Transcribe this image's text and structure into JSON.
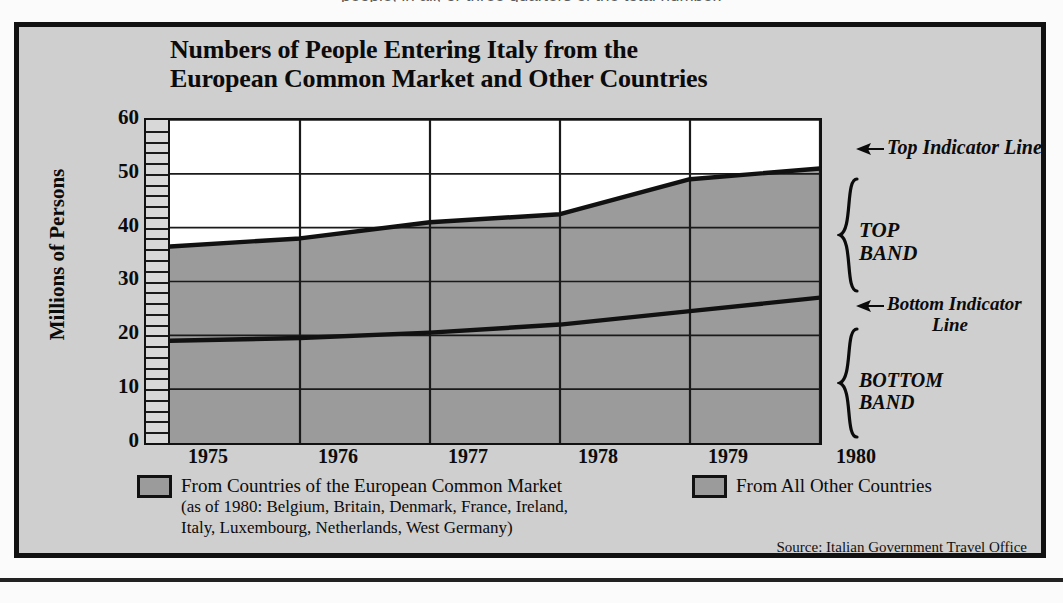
{
  "page": {
    "top_cut_text": "people, in all, or three quarters of the total number.",
    "source_note": "Source: Italian Government Travel Office"
  },
  "chart_title": {
    "line1": "Numbers of People Entering Italy from the",
    "line2": "European Common Market and Other Countries"
  },
  "annotations": {
    "top_indicator_line": "Top Indicator Line",
    "top_band_l1": "TOP",
    "top_band_l2": "BAND",
    "bottom_indicator_line_l1": "Bottom Indicator",
    "bottom_indicator_line_l2": "Line",
    "bottom_band_l1": "BOTTOM",
    "bottom_band_l2": "BAND"
  },
  "legend": {
    "items": [
      {
        "label": "From Countries of the European Common Market",
        "sub_l1": "(as of 1980: Belgium, Britain, Denmark, France, Ireland,",
        "sub_l2": "Italy, Luxembourg, Netherlands, West Germany)",
        "color": "#9b9b9b"
      },
      {
        "label": "From All Other Countries",
        "sub_l1": "",
        "sub_l2": "",
        "color": "#9b9b9b"
      }
    ]
  },
  "colors": {
    "page_background": "#fbfbfb",
    "figure_background": "#cfcfcf",
    "plot_background": "#ffffff",
    "band_fill": "#9b9b9b",
    "line_color": "#111111",
    "border_color": "#111111"
  },
  "chart_data": {
    "type": "area",
    "title": "Numbers of People Entering Italy from the European Common Market and Other Countries",
    "xlabel": "",
    "ylabel": "Millions of Persons",
    "categories": [
      "1975",
      "1976",
      "1977",
      "1978",
      "1979",
      "1980"
    ],
    "x": [
      1975,
      1976,
      1977,
      1978,
      1979,
      1980
    ],
    "xlim": [
      1975,
      1980
    ],
    "ylim": [
      0,
      60
    ],
    "ytick_labels": [
      "0",
      "10",
      "20",
      "30",
      "40",
      "50",
      "60"
    ],
    "yticks": [
      0,
      10,
      20,
      30,
      40,
      50,
      60
    ],
    "y_minor_tick_step": 2,
    "grid": true,
    "legend_position": "below",
    "stacked": true,
    "series": [
      {
        "name": "From Countries of the European Common Market",
        "role": "bottom-band",
        "indicator_line": "Bottom Indicator Line",
        "values": [
          19,
          19.5,
          20.5,
          22,
          24.5,
          27
        ]
      },
      {
        "name": "From All Other Countries",
        "role": "top-band",
        "indicator_line": "Top Indicator Line",
        "cumulative_values": [
          36.5,
          38,
          41,
          42.5,
          49,
          51
        ],
        "values": [
          17.5,
          18.5,
          20.5,
          20.5,
          24.5,
          24
        ]
      }
    ]
  }
}
